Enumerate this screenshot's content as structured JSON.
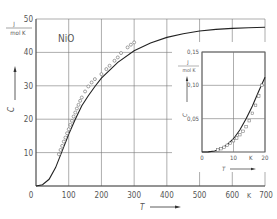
{
  "chart_data": [
    {
      "type": "line",
      "title": "NiO",
      "xlabel": "T",
      "xunit": "K",
      "ylabel": "C_V",
      "yunit_num": "J",
      "yunit_den": "mol K",
      "xlim": [
        0,
        700
      ],
      "ylim": [
        0,
        50
      ],
      "xticks": [
        0,
        100,
        200,
        300,
        400,
        500,
        600,
        700
      ],
      "xtick_labels": [
        "0",
        "100",
        "200",
        "300",
        "400",
        "500",
        "600",
        "700"
      ],
      "yticks": [
        0,
        10,
        20,
        30,
        40,
        50
      ],
      "ytick_labels": [
        "0",
        "10",
        "20",
        "30",
        "40",
        "50"
      ],
      "grid": true,
      "series": [
        {
          "name": "theory curve",
          "style": "solid line",
          "x": [
            0,
            20,
            40,
            60,
            80,
            100,
            120,
            140,
            160,
            180,
            200,
            250,
            300,
            350,
            400,
            450,
            500,
            550,
            600,
            650,
            700
          ],
          "y": [
            0,
            0.4,
            2.0,
            5.5,
            10.5,
            15.5,
            20.0,
            24.0,
            27.0,
            29.8,
            32.3,
            37.0,
            40.5,
            42.8,
            44.5,
            45.6,
            46.4,
            46.9,
            47.2,
            47.4,
            47.5
          ]
        },
        {
          "name": "experimental data",
          "style": "open circles",
          "x": [
            70,
            75,
            80,
            85,
            90,
            95,
            100,
            105,
            110,
            115,
            120,
            125,
            130,
            135,
            140,
            150,
            160,
            170,
            180,
            200,
            215,
            225,
            240,
            250,
            260,
            280,
            290,
            300
          ],
          "y": [
            9.5,
            10.8,
            12.0,
            13.3,
            14.5,
            15.8,
            17.0,
            18.3,
            19.5,
            20.8,
            22.0,
            23.2,
            24.3,
            25.5,
            26.5,
            28.3,
            29.8,
            31.0,
            32.0,
            33.5,
            35.0,
            36.0,
            37.5,
            38.5,
            39.8,
            41.5,
            42.3,
            43.0
          ]
        }
      ]
    },
    {
      "type": "line",
      "title": "inset (low temperature)",
      "xlabel": "T",
      "xunit": "K",
      "ylabel": "C_V",
      "yunit_num": "J",
      "yunit_den": "mol K",
      "xlim": [
        0,
        20
      ],
      "ylim": [
        0,
        0.15
      ],
      "xticks": [
        0,
        10,
        20
      ],
      "xtick_labels": [
        "0",
        "10",
        "20"
      ],
      "yticks": [
        0.05,
        0.1,
        0.15
      ],
      "ytick_labels": [
        "0,05",
        "0,10",
        "0,15"
      ],
      "grid": true,
      "series": [
        {
          "name": "theory curve",
          "style": "solid line",
          "x": [
            0,
            2,
            4,
            6,
            8,
            10,
            12,
            14,
            16,
            18,
            20
          ],
          "y": [
            0,
            0.0002,
            0.0015,
            0.005,
            0.011,
            0.02,
            0.033,
            0.05,
            0.069,
            0.091,
            0.112
          ]
        },
        {
          "name": "experimental data",
          "style": "open squares",
          "x": [
            5,
            6,
            7,
            8,
            9,
            10,
            11,
            12,
            13,
            14,
            15,
            16,
            17,
            18,
            19
          ],
          "y": [
            0.003,
            0.005,
            0.007,
            0.01,
            0.013,
            0.017,
            0.021,
            0.026,
            0.031,
            0.038,
            0.047,
            0.058,
            0.07,
            0.084,
            0.1
          ]
        }
      ]
    }
  ],
  "labels": {
    "title": "NiO",
    "y_unit_num": "J",
    "y_unit_den": "mol K",
    "y_symbol": "C",
    "y_sub": "V",
    "x_symbol": "T",
    "x_unit": "K",
    "inset_y_unit_num": "J",
    "inset_y_unit_den": "mol K",
    "inset_x_symbol": "T",
    "inset_x_unit": "K"
  },
  "colors": {
    "line": "#222222",
    "grid": "#777777",
    "text": "#555555",
    "marker": "#666666"
  }
}
